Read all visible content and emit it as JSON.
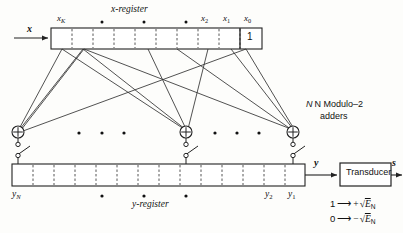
{
  "figure": {
    "type": "block-diagram"
  },
  "labels": {
    "x_register": "x-register",
    "y_register": "y-register",
    "input_x": "x",
    "output_y": "y",
    "output_s": "s",
    "adders_line1": "N Modulo–2",
    "adders_line2": "adders",
    "transducer": "Transducer"
  },
  "x_register": {
    "cell_labels": [
      "x",
      "x",
      "x",
      "x"
    ],
    "tick_names": [
      "x_K",
      "x_2",
      "x_1",
      "x_0"
    ],
    "xK": "x",
    "xK_sub": "K",
    "x2": "x",
    "x2_sub": "2",
    "x1": "x",
    "x1_sub": "1",
    "x0": "x",
    "x0_sub": "0",
    "last_cell_value": "1",
    "ellipsis_dots": 3
  },
  "y_register": {
    "yN": "y",
    "yN_sub": "N",
    "y2": "y",
    "y2_sub": "2",
    "y1": "y",
    "y1_sub": "1",
    "ellipsis_dots": 3
  },
  "adders": {
    "symbol": "+",
    "count_label": "N",
    "left_dots": 3,
    "right_dots": 3
  },
  "mapping": {
    "row1_bit": "1",
    "row1_arrow": "⟶",
    "row1_sign": "+",
    "row1_radical": "√",
    "row1_var": "E",
    "row1_sub": "N",
    "row2_bit": "0",
    "row2_arrow": "⟶",
    "row2_sign": "−",
    "row2_radical": "√",
    "row2_var": "E",
    "row2_sub": "N"
  },
  "colors": {
    "ink": "#111111",
    "line": "#222222",
    "dashed": "#666666",
    "background": "#fdfdfb"
  }
}
